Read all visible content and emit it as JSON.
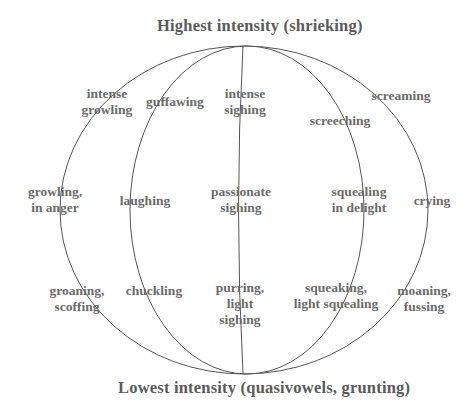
{
  "diagram": {
    "type": "globe-ellipse-diagram",
    "top_label": "Highest intensity (shrieking)",
    "bottom_label": "Lowest intensity (quasivowels, grunting)",
    "line_color": "#555555",
    "text_color": "#6a6a6a",
    "labels": {
      "intense_growling": [
        "intense",
        "growling"
      ],
      "guffawing": [
        "guffawing"
      ],
      "intense_sighing": [
        "intense",
        "sighing"
      ],
      "screeching": [
        "screeching"
      ],
      "screaming": [
        "screaming"
      ],
      "growling_anger": [
        "growling,",
        "in anger"
      ],
      "laughing": [
        "laughing"
      ],
      "passionate_sighing": [
        "passionate",
        "sighing"
      ],
      "squealing_delight": [
        "squealing",
        "in delight"
      ],
      "crying": [
        "crying"
      ],
      "groaning": [
        "groaning,",
        "scoffing"
      ],
      "chuckling": [
        "chuckling"
      ],
      "purring": [
        "purring,",
        "light",
        "sighing"
      ],
      "squeaking": [
        "squeaking,",
        "light squealing"
      ],
      "moaning": [
        "moaning,",
        "fussing"
      ]
    }
  }
}
